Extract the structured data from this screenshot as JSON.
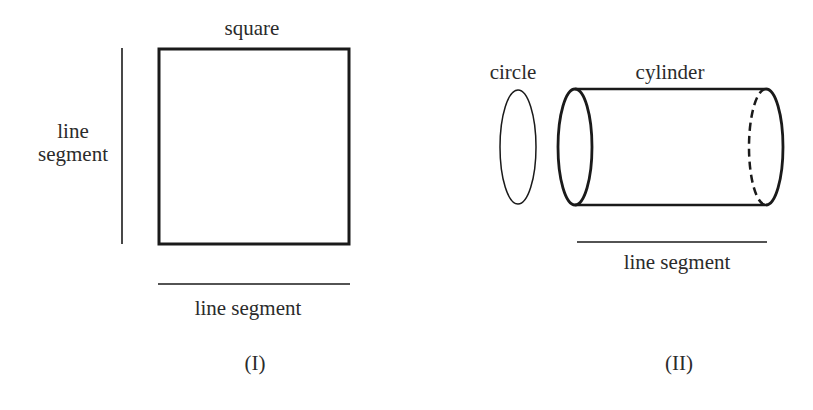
{
  "panel_i": {
    "caption": "(I)",
    "square_label": "square",
    "vertical_segment_label_line1": "line",
    "vertical_segment_label_line2": "segment",
    "horizontal_segment_label": "line segment"
  },
  "panel_ii": {
    "caption": "(II)",
    "circle_label": "circle",
    "cylinder_label": "cylinder",
    "horizontal_segment_label": "line segment"
  },
  "colors": {
    "stroke": "#1a1a1a",
    "text": "#2b2b2b",
    "background": "#ffffff"
  }
}
